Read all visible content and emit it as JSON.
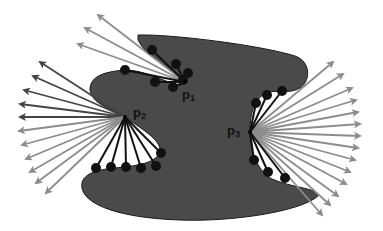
{
  "diagram": {
    "colors": {
      "shape_fill": "#4a4a4a",
      "shape_stroke": "#1a1a1a",
      "dot": "#111111",
      "segment": "#111111",
      "arrow_dark": "#444444",
      "arrow_light": "#8c8c8c",
      "background": "#ffffff"
    },
    "points": [
      {
        "id": "p1",
        "label": "p",
        "sub": "1",
        "x": 185,
        "y": 82,
        "label_x": 182,
        "label_y": 88
      },
      {
        "id": "p2",
        "label": "p",
        "sub": "2",
        "x": 125,
        "y": 117,
        "label_x": 133,
        "label_y": 107
      },
      {
        "id": "p3",
        "label": "p",
        "sub": "3",
        "x": 250,
        "y": 132,
        "label_x": 227,
        "label_y": 124
      }
    ],
    "sample_dots": {
      "p1": [
        [
          152,
          50
        ],
        [
          176,
          64
        ],
        [
          188,
          73
        ],
        [
          125,
          70
        ],
        [
          155,
          82
        ],
        [
          173,
          87
        ],
        [
          183,
          80
        ]
      ],
      "p2": [
        [
          96,
          168
        ],
        [
          111,
          167
        ],
        [
          126,
          167
        ],
        [
          141,
          168
        ],
        [
          156,
          166
        ],
        [
          161,
          153
        ]
      ],
      "p3": [
        [
          256,
          103
        ],
        [
          267,
          95
        ],
        [
          282,
          91
        ],
        [
          254,
          160
        ],
        [
          268,
          172
        ],
        [
          285,
          178
        ]
      ]
    },
    "arrow_fans": {
      "p1": [
        [
          98,
          15
        ],
        [
          85,
          28
        ],
        [
          78,
          44
        ]
      ],
      "p2": [
        [
          40,
          62
        ],
        [
          33,
          76
        ],
        [
          24,
          90
        ],
        [
          20,
          104
        ],
        [
          20,
          117
        ],
        [
          19,
          131
        ],
        [
          22,
          145
        ],
        [
          26,
          159
        ],
        [
          30,
          172
        ],
        [
          36,
          183
        ],
        [
          46,
          193
        ]
      ],
      "p3": [
        [
          333,
          62
        ],
        [
          343,
          74
        ],
        [
          352,
          88
        ],
        [
          356,
          100
        ],
        [
          358,
          112
        ],
        [
          360,
          124
        ],
        [
          360,
          136
        ],
        [
          358,
          148
        ],
        [
          355,
          160
        ],
        [
          350,
          172
        ],
        [
          346,
          184
        ],
        [
          338,
          196
        ],
        [
          330,
          205
        ],
        [
          322,
          215
        ]
      ]
    }
  }
}
